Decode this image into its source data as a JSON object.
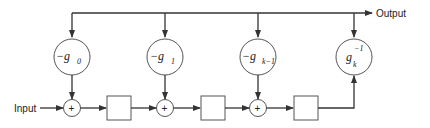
{
  "diagram": {
    "input_label": "Input",
    "output_label": "Output",
    "coefficients": [
      {
        "sign": "−",
        "base": "g",
        "sub": "0",
        "sup": ""
      },
      {
        "sign": "−",
        "base": "g",
        "sub": "1",
        "sup": ""
      },
      {
        "sign": "−",
        "base": "g",
        "sub": "k−1",
        "sup": ""
      },
      {
        "sign": "",
        "base": "g",
        "sub": "k",
        "sup": "−1"
      }
    ],
    "adder_symbol": "+",
    "delay_count": 3,
    "adder_count": 3
  }
}
